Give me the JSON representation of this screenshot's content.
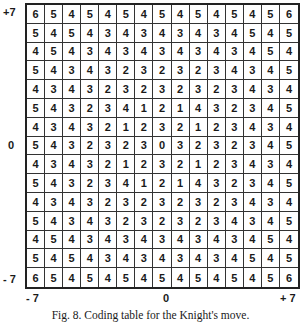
{
  "figure": {
    "caption": "Fig. 8.  Coding table for the Knight's move.",
    "y_axis": {
      "top": "+7",
      "middle": "0",
      "bottom": "- 7"
    },
    "x_axis": {
      "left": "- 7",
      "middle": "0",
      "right": "+ 7"
    }
  },
  "chart_data": {
    "type": "table",
    "title": "Coding table for the Knight's move",
    "x_range": [
      -7,
      7
    ],
    "y_range": [
      -7,
      7
    ],
    "rows": [
      [
        6,
        5,
        4,
        5,
        4,
        5,
        4,
        5,
        4,
        5,
        4,
        5,
        4,
        5,
        6
      ],
      [
        5,
        4,
        5,
        4,
        3,
        4,
        3,
        4,
        3,
        4,
        3,
        4,
        5,
        4,
        5
      ],
      [
        4,
        5,
        4,
        3,
        4,
        3,
        4,
        3,
        4,
        3,
        4,
        3,
        4,
        5,
        4
      ],
      [
        5,
        4,
        3,
        4,
        3,
        2,
        3,
        2,
        3,
        2,
        3,
        4,
        3,
        4,
        5
      ],
      [
        4,
        3,
        4,
        3,
        2,
        3,
        2,
        3,
        2,
        3,
        2,
        3,
        4,
        3,
        4
      ],
      [
        5,
        4,
        3,
        2,
        3,
        4,
        1,
        2,
        1,
        4,
        3,
        2,
        3,
        4,
        5
      ],
      [
        4,
        3,
        4,
        3,
        2,
        1,
        2,
        3,
        2,
        1,
        2,
        3,
        4,
        3,
        4
      ],
      [
        5,
        4,
        3,
        2,
        3,
        2,
        3,
        0,
        3,
        2,
        3,
        2,
        3,
        4,
        5
      ],
      [
        4,
        3,
        4,
        3,
        2,
        1,
        2,
        3,
        2,
        1,
        2,
        3,
        4,
        3,
        4
      ],
      [
        5,
        4,
        3,
        2,
        3,
        4,
        1,
        2,
        1,
        4,
        3,
        2,
        3,
        4,
        5
      ],
      [
        4,
        3,
        4,
        3,
        2,
        3,
        2,
        3,
        2,
        3,
        2,
        3,
        4,
        3,
        4
      ],
      [
        5,
        4,
        3,
        4,
        3,
        2,
        3,
        2,
        3,
        2,
        3,
        4,
        3,
        4,
        5
      ],
      [
        4,
        5,
        4,
        3,
        4,
        3,
        4,
        3,
        4,
        3,
        4,
        3,
        4,
        5,
        4
      ],
      [
        5,
        4,
        5,
        4,
        3,
        4,
        3,
        4,
        3,
        4,
        3,
        4,
        5,
        4,
        5
      ],
      [
        6,
        5,
        4,
        5,
        4,
        5,
        4,
        5,
        4,
        5,
        4,
        5,
        4,
        5,
        6
      ]
    ]
  }
}
